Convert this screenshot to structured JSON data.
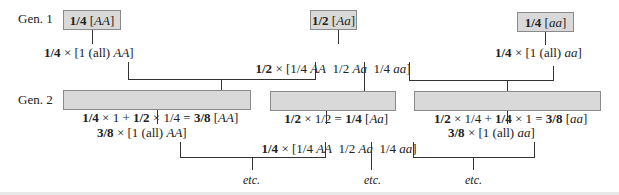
{
  "gen1": {
    "label": "Gen. 1",
    "boxes": [
      {
        "frac": "1/4",
        "genotype": "AA"
      },
      {
        "frac": "1/2",
        "genotype": "Aa"
      },
      {
        "frac": "1/4",
        "genotype": "aa"
      }
    ],
    "offspring": [
      {
        "frac": "1/4",
        "pre": "[1 (all) ",
        "g": "AA",
        "post": "]"
      },
      {
        "frac": "1/2",
        "pre": "[1/4 ",
        "g1": "AA",
        "m1": "  1/2 ",
        "g2": "Aa",
        "m2": "  1/4 ",
        "g3": "aa",
        "post": "]"
      },
      {
        "frac": "1/4",
        "pre": "[1 (all) ",
        "g": "aa",
        "post": "]"
      }
    ]
  },
  "gen2": {
    "label": "Gen. 2",
    "boxes": [
      {
        "a": "1/4",
        "b": " × 1 + ",
        "c": "1/2",
        "d": " × 1/4 = ",
        "e": "3/8",
        "genotype": "AA"
      },
      {
        "a": "1/2",
        "b": " × 1/2 = ",
        "e": "1/4",
        "genotype": "Aa"
      },
      {
        "a": "1/2",
        "b": " × 1/4 + ",
        "c": "1/4",
        "d": " × 1 = ",
        "e": "3/8",
        "genotype": "aa"
      }
    ],
    "offspring": [
      {
        "frac": "3/8",
        "pre": "[1 (all) ",
        "g": "AA",
        "post": "]"
      },
      {
        "frac": "1/4",
        "pre": "[1/4 ",
        "g1": "AA",
        "m1": "  1/2 ",
        "g2": "Aa",
        "m2": "  1/4 ",
        "g3": "aa",
        "post": "]"
      },
      {
        "frac": "3/8",
        "pre": "[1 (all) ",
        "g": "aa",
        "post": "]"
      }
    ]
  },
  "times": " × ",
  "etc": [
    "etc.",
    "etc.",
    "etc."
  ]
}
